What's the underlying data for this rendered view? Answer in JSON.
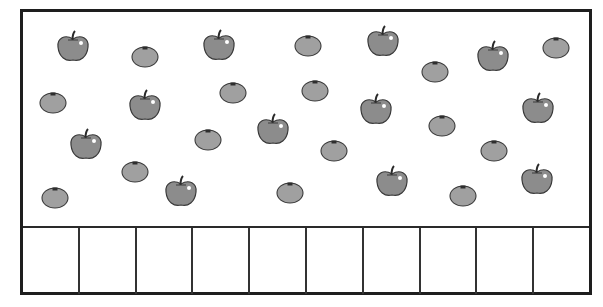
{
  "worksheet": {
    "counting_boxes": 10,
    "big_apples": [
      {
        "x": 73,
        "y": 48
      },
      {
        "x": 219,
        "y": 47
      },
      {
        "x": 383,
        "y": 43
      },
      {
        "x": 493,
        "y": 58
      },
      {
        "x": 145,
        "y": 107
      },
      {
        "x": 273,
        "y": 131
      },
      {
        "x": 376,
        "y": 111
      },
      {
        "x": 538,
        "y": 110
      },
      {
        "x": 86,
        "y": 146
      },
      {
        "x": 181,
        "y": 193
      },
      {
        "x": 392,
        "y": 183
      },
      {
        "x": 537,
        "y": 181
      }
    ],
    "small_apples": [
      {
        "x": 145,
        "y": 56
      },
      {
        "x": 308,
        "y": 45
      },
      {
        "x": 435,
        "y": 71
      },
      {
        "x": 556,
        "y": 47
      },
      {
        "x": 53,
        "y": 102
      },
      {
        "x": 233,
        "y": 92
      },
      {
        "x": 315,
        "y": 90
      },
      {
        "x": 442,
        "y": 125
      },
      {
        "x": 208,
        "y": 139
      },
      {
        "x": 334,
        "y": 150
      },
      {
        "x": 494,
        "y": 150
      },
      {
        "x": 135,
        "y": 171
      },
      {
        "x": 55,
        "y": 197
      },
      {
        "x": 290,
        "y": 192
      },
      {
        "x": 463,
        "y": 195
      }
    ]
  },
  "colors": {
    "frame": "#1e1e1e",
    "apple_fill": "#8c8c8c",
    "apple_stroke": "#3a3a3a",
    "small_apple_fill": "#a0a0a0"
  }
}
